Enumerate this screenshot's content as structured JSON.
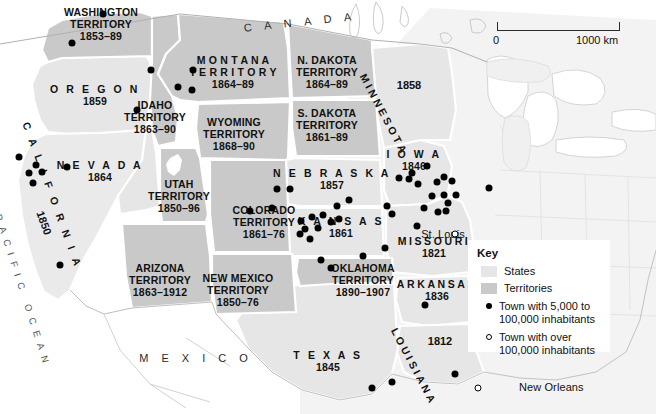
{
  "map": {
    "title": "United States States and Territories",
    "colors": {
      "state_fill": "#e6e6e6",
      "territory_fill": "#c9c9c9",
      "faded_fill": "#f2f2f2",
      "water": "#ffffff",
      "border": "#ffffff",
      "outline": "#b9b9b9",
      "dot": "#000000"
    },
    "scale": {
      "start": "0",
      "end": "1000 km"
    },
    "countries": [
      {
        "name": "C A N A D A",
        "x": 300,
        "y": 22,
        "rotate": -6
      },
      {
        "name": "M E X I C O",
        "x": 196,
        "y": 358,
        "rotate": 0
      }
    ],
    "oceans": [
      {
        "name": "PACIFIC OCEAN",
        "x": 22,
        "y": 290,
        "rotate": 72
      }
    ],
    "regions": [
      {
        "name": "WASHINGTON TERRITORY",
        "years": "1853–89",
        "type": "territory",
        "x": 101,
        "y": 25,
        "lines": [
          "WASHINGTON",
          "TERRITORY"
        ]
      },
      {
        "name": "OREGON",
        "years": "1859",
        "type": "state",
        "x": 95,
        "y": 96,
        "lines": [
          "O R E G O N"
        ]
      },
      {
        "name": "IDAHO TERRITORY",
        "years": "1863–90",
        "type": "territory",
        "x": 155,
        "y": 118,
        "lines": [
          "IDAHO",
          "TERRITORY"
        ]
      },
      {
        "name": "MONTANA TERRITORY",
        "years": "1864–89",
        "type": "territory",
        "x": 233,
        "y": 73,
        "lines": [
          "M O N T A N A",
          "T E R R I T O R Y"
        ]
      },
      {
        "name": "N. DAKOTA TERRITORY",
        "years": "1864–89",
        "type": "territory",
        "x": 327,
        "y": 73,
        "lines": [
          "N. DAKOTA",
          "TERRITORY"
        ]
      },
      {
        "name": "S. DAKOTA TERRITORY",
        "years": "1861–89",
        "type": "territory",
        "x": 327,
        "y": 126,
        "lines": [
          "S. DAKOTA",
          "TERRITORY"
        ]
      },
      {
        "name": "WYOMING TERRITORY",
        "years": "1868–90",
        "type": "territory",
        "x": 234,
        "y": 135,
        "lines": [
          "WYOMING",
          "TERRITORY"
        ]
      },
      {
        "name": "NEVADA",
        "years": "1864",
        "type": "state",
        "x": 100,
        "y": 172,
        "lines": [
          "N E V A D A"
        ]
      },
      {
        "name": "UTAH TERRITORY",
        "years": "1850–96",
        "type": "territory",
        "x": 179,
        "y": 197,
        "lines": [
          "UTAH",
          "TERRITORY"
        ]
      },
      {
        "name": "COLORADO TERRITORY",
        "years": "1861–76",
        "type": "territory",
        "x": 264,
        "y": 223,
        "lines": [
          "COLORADO",
          "TERRITORY"
        ]
      },
      {
        "name": "NEBRASKA",
        "years": "1857",
        "type": "state",
        "x": 332,
        "y": 180,
        "lines": [
          "N E B R A S K A"
        ]
      },
      {
        "name": "KANSAS",
        "years": "1861",
        "type": "state",
        "x": 341,
        "y": 228,
        "lines": [
          "K A N S A S"
        ]
      },
      {
        "name": "IOWA",
        "years": "1846",
        "type": "state",
        "x": 414,
        "y": 161,
        "lines": [
          "I O W A"
        ]
      },
      {
        "name": "MISSOURI",
        "years": "1821",
        "type": "state",
        "x": 434,
        "y": 248,
        "lines": [
          "MISSOURI"
        ]
      },
      {
        "name": "ARIZONA TERRITORY",
        "years": "1863–1912",
        "type": "territory",
        "x": 160,
        "y": 281,
        "lines": [
          "ARIZONA",
          "TERRITORY"
        ]
      },
      {
        "name": "NEW MEXICO TERRITORY",
        "years": "1850–76",
        "type": "territory",
        "x": 238,
        "y": 291,
        "lines": [
          "NEW MEXICO",
          "TERRITORY"
        ]
      },
      {
        "name": "OKLAHOMA TERRITORY",
        "years": "1890–1907",
        "type": "territory",
        "x": 363,
        "y": 281,
        "lines": [
          "OKLAHOMA",
          "TERRITORY"
        ]
      },
      {
        "name": "ARKANSAS",
        "years": "1836",
        "type": "state",
        "x": 437,
        "y": 291,
        "lines": [
          "ARKANSAS"
        ]
      },
      {
        "name": "TEXAS",
        "years": "1845",
        "type": "state",
        "x": 328,
        "y": 362,
        "lines": [
          "T E X A S"
        ]
      }
    ],
    "rotated_regions": [
      {
        "name": "CALIFORNIA",
        "years": "1850",
        "x": 52,
        "y": 196,
        "rotate": 70,
        "letter_spacing": "4.4px"
      },
      {
        "name": "MINNESOTA",
        "years": "1858",
        "x": 383,
        "y": 114,
        "rotate": 62,
        "letter_spacing": "1.1px"
      },
      {
        "name": "LOUISIANA",
        "years": "1812",
        "x": 413,
        "y": 366,
        "rotate": 62,
        "letter_spacing": "1.1px"
      }
    ],
    "rotated_years": [
      {
        "value": "1850",
        "x": 44,
        "y": 223,
        "rotate": 70
      },
      {
        "value": "1858",
        "x": 409,
        "y": 85,
        "rotate": 0
      },
      {
        "value": "1812",
        "x": 440,
        "y": 341,
        "rotate": 0
      }
    ],
    "cities": [
      {
        "name": "St. Louis",
        "x": 443,
        "y": 234,
        "type": "large"
      },
      {
        "name": "New Orleans",
        "x": 519,
        "y": 387,
        "type": "large"
      }
    ],
    "towns_small": [
      [
        103,
        14
      ],
      [
        72,
        43
      ],
      [
        151,
        70
      ],
      [
        193,
        70
      ],
      [
        137,
        110
      ],
      [
        178,
        87
      ],
      [
        192,
        90
      ],
      [
        19,
        157
      ],
      [
        36,
        165
      ],
      [
        29,
        173
      ],
      [
        42,
        172
      ],
      [
        33,
        183
      ],
      [
        67,
        167
      ],
      [
        60,
        265
      ],
      [
        277,
        189
      ],
      [
        290,
        189
      ],
      [
        250,
        211
      ],
      [
        272,
        208
      ],
      [
        387,
        206
      ],
      [
        392,
        214
      ],
      [
        417,
        226
      ],
      [
        399,
        178
      ],
      [
        409,
        179
      ],
      [
        412,
        173
      ],
      [
        427,
        166
      ],
      [
        437,
        182
      ],
      [
        444,
        177
      ],
      [
        452,
        181
      ],
      [
        432,
        196
      ],
      [
        444,
        195
      ],
      [
        456,
        195
      ],
      [
        424,
        208
      ],
      [
        438,
        212
      ],
      [
        446,
        211
      ],
      [
        448,
        203
      ],
      [
        301,
        221
      ],
      [
        312,
        217
      ],
      [
        323,
        215
      ],
      [
        305,
        229
      ],
      [
        318,
        228
      ],
      [
        331,
        222
      ],
      [
        339,
        219
      ],
      [
        300,
        234
      ],
      [
        310,
        239
      ],
      [
        321,
        260
      ],
      [
        363,
        256
      ],
      [
        385,
        248
      ],
      [
        331,
        268
      ],
      [
        425,
        305
      ],
      [
        372,
        388
      ],
      [
        392,
        382
      ],
      [
        455,
        374
      ],
      [
        337,
        206
      ],
      [
        349,
        200
      ],
      [
        418,
        184
      ],
      [
        489,
        188
      ]
    ],
    "towns_large": [
      [
        455,
        234
      ],
      [
        478,
        388
      ]
    ],
    "key": {
      "title": "Key",
      "items": [
        {
          "kind": "swatch-states",
          "label": "States"
        },
        {
          "kind": "swatch-territories",
          "label": "Territories"
        },
        {
          "kind": "dot-filled",
          "label": "Town with 5,000 to 100,000 inhabitants"
        },
        {
          "kind": "dot-open",
          "label": "Town with over 100,000 inhabitants"
        }
      ]
    }
  }
}
